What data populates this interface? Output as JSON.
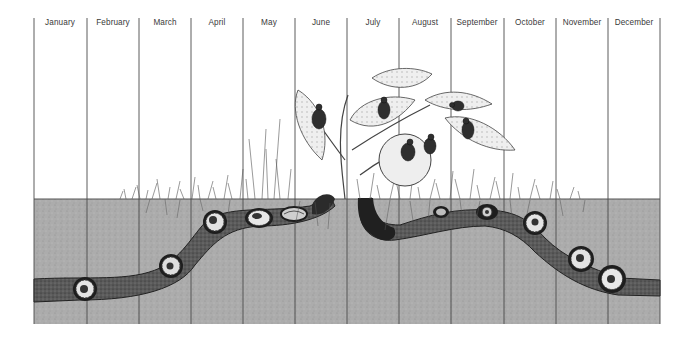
{
  "diagram": {
    "months": [
      "January",
      "February",
      "March",
      "April",
      "May",
      "June",
      "July",
      "August",
      "September",
      "October",
      "November",
      "December"
    ],
    "colors": {
      "background": "#ffffff",
      "soil": "#a9a9a9",
      "tunnel": "#5e5e5e",
      "tunnel_dark": "#2a2a2a",
      "line": "#3a3a3a",
      "larva": "#e6e6e6",
      "leaf": "#d8d8d8",
      "fruit": "#ececec",
      "beetle": "#333333"
    },
    "regions": {
      "above_ground": "plant with leaves, fruit and feeding adult beetles (June–September), grass along surface",
      "below_ground": "grey soil with tunnel containing coiled larvae and pupae"
    }
  }
}
